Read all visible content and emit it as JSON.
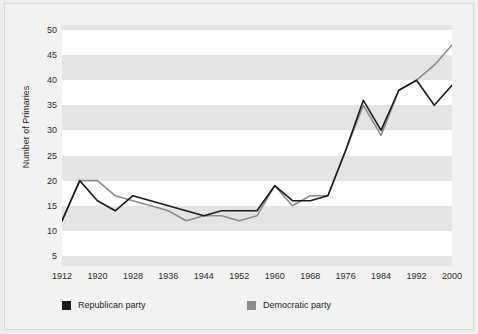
{
  "chart_data": {
    "type": "line",
    "title": "",
    "xlabel": "",
    "ylabel": "Number of Primaries",
    "x": [
      1912,
      1916,
      1920,
      1924,
      1928,
      1932,
      1936,
      1940,
      1944,
      1948,
      1952,
      1956,
      1960,
      1964,
      1968,
      1972,
      1976,
      1980,
      1984,
      1988,
      1992,
      1996,
      2000
    ],
    "xlim": [
      1912,
      2000
    ],
    "ylim": [
      3,
      51
    ],
    "xticks": [
      1912,
      1920,
      1928,
      1936,
      1944,
      1952,
      1960,
      1968,
      1976,
      1984,
      1992,
      2000
    ],
    "yticks": [
      5,
      10,
      15,
      20,
      25,
      30,
      35,
      40,
      45,
      50
    ],
    "grid": "horizontal-alternating-bands",
    "legend_position": "below-axes-left",
    "series": [
      {
        "name": "Republican party",
        "color": "#1a1a1a",
        "values": [
          12,
          20,
          16,
          14,
          17,
          16,
          15,
          14,
          13,
          14,
          14,
          14,
          19,
          16,
          16,
          17,
          26,
          36,
          30,
          38,
          40,
          35,
          39
        ]
      },
      {
        "name": "Democratic party",
        "color": "#8c8c8c",
        "values": [
          12,
          20,
          20,
          17,
          16,
          15,
          14,
          12,
          13,
          13,
          12,
          13,
          19,
          15,
          17,
          17,
          26,
          35,
          29,
          38,
          40,
          43,
          47
        ]
      }
    ]
  },
  "axes": {
    "y_title": "Number of Primaries",
    "y_tick_labels": [
      "50",
      "45",
      "40",
      "35",
      "30",
      "25",
      "20",
      "15",
      "10",
      "5"
    ],
    "x_tick_labels": [
      "1912",
      "1920",
      "1928",
      "1936",
      "1944",
      "1952",
      "1960",
      "1968",
      "1976",
      "1984",
      "1992",
      "2000"
    ]
  },
  "legend": {
    "items": [
      {
        "label": "Republican party",
        "color": "#1a1a1a"
      },
      {
        "label": "Democratic party",
        "color": "#8c8c8c"
      }
    ]
  },
  "colors": {
    "republican": "#1a1a1a",
    "democratic": "#8c8c8c",
    "band": "#e4e4e4",
    "plot_background": "#ffffff",
    "panel_background": "#f2f2f2",
    "panel_border": "#d8d8d8",
    "text": "#2b2b2b"
  }
}
